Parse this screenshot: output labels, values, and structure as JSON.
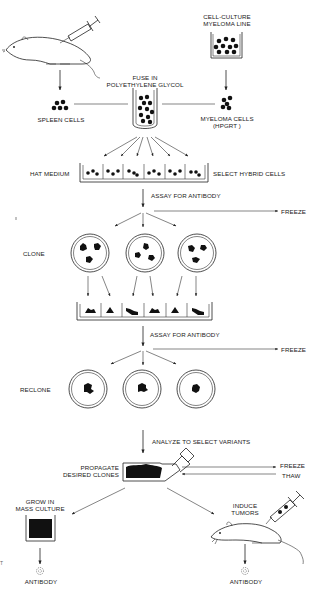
{
  "diagram": {
    "type": "process-flow",
    "colors": {
      "ink": "#1a1a1a",
      "background": "#ffffff"
    },
    "labels": {
      "cell_culture_line1": "CELL-CULTURE",
      "cell_culture_line2": "MYELOMA LINE",
      "fuse_line1": "FUSE IN",
      "fuse_line2": "POLYETHYLENE GLYCOL",
      "spleen_cells": "SPLEEN CELLS",
      "myeloma_cells_line1": "MYELOMA CELLS",
      "myeloma_cells_line2": "(HPGRT )",
      "hat_medium": "HAT MEDIUM",
      "select_hybrid": "SELECT HYBRID CELLS",
      "assay_1": "ASSAY FOR ANTIBODY",
      "freeze_1": "FREEZE",
      "clone": "CLONE",
      "assay_2": "ASSAY FOR ANTIBODY",
      "freeze_2": "FREEZE",
      "reclone": "RECLONE",
      "analyze": "ANALYZE TO SELECT VARIANTS",
      "propagate_line1": "PROPAGATE",
      "propagate_line2": "DESIRED CLONES",
      "freeze_3": "FREEZE",
      "thaw": "THAW",
      "grow_line1": "GROW IN",
      "grow_line2": "MASS CULTURE",
      "induce_line1": "INDUCE",
      "induce_line2": "TUMORS",
      "antibody_left": "ANTIBODY",
      "antibody_right": "ANTIBODY",
      "stray_mark": "t"
    },
    "icons": [
      "mouse-icon",
      "syringe-icon",
      "beaker-icon",
      "test-tube-icon",
      "culture-well-tray-icon",
      "petri-dish-icon",
      "culture-flask-icon",
      "antibody-icon"
    ]
  }
}
